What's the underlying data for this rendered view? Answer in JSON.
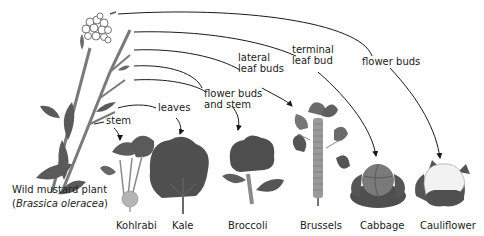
{
  "diagram": {
    "ancestor": {
      "name": "Wild mustard plant",
      "scientific_name": "Brassica oleracea"
    },
    "feature_labels": [
      {
        "id": "stem",
        "text": "stem"
      },
      {
        "id": "leaves",
        "text": "leaves"
      },
      {
        "id": "flower-buds-stem",
        "text": "flower buds\nand stem"
      },
      {
        "id": "lateral-leaf-buds",
        "text": "lateral\nleaf buds"
      },
      {
        "id": "terminal-leaf-bud",
        "text": "terminal\nleaf bud"
      },
      {
        "id": "flower-buds",
        "text": "flower buds"
      }
    ],
    "vegetables": [
      {
        "name": "Kohlrabi",
        "selected_feature": "stem"
      },
      {
        "name": "Kale",
        "selected_feature": "leaves"
      },
      {
        "name": "Broccoli",
        "selected_feature": "flower buds and stem"
      },
      {
        "name": "Brussels",
        "selected_feature": "lateral leaf buds"
      },
      {
        "name": "Cabbage",
        "selected_feature": "terminal leaf bud"
      },
      {
        "name": "Cauliflower",
        "selected_feature": "flower buds"
      }
    ],
    "colors": {
      "plant": "#6b6b6b",
      "plant_dark": "#4f4f4f",
      "plant_light": "#8a8a8a",
      "kohlrabi_bulb": "#b5b5b5",
      "cauliflower_head": "#f2f2f2",
      "line": "#1a1a1a"
    }
  }
}
